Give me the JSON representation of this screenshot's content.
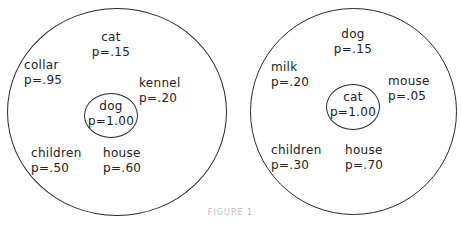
{
  "diagrams": [
    {
      "center": {
        "word": "dog",
        "p": "p=1.00"
      },
      "associates": [
        {
          "word": "cat",
          "p": "p=.15"
        },
        {
          "word": "collar",
          "p": "p=.95"
        },
        {
          "word": "kennel",
          "p": "p=.20"
        },
        {
          "word": "children",
          "p": "p=.50"
        },
        {
          "word": "house",
          "p": "p=.60"
        }
      ]
    },
    {
      "center": {
        "word": "cat",
        "p": "p=1.00"
      },
      "associates": [
        {
          "word": "dog",
          "p": "p=.15"
        },
        {
          "word": "milk",
          "p": "p=.20"
        },
        {
          "word": "mouse",
          "p": "p=.05"
        },
        {
          "word": "children",
          "p": "p=.30"
        },
        {
          "word": "house",
          "p": "p=.70"
        }
      ]
    }
  ],
  "caption": "FIGURE 1"
}
